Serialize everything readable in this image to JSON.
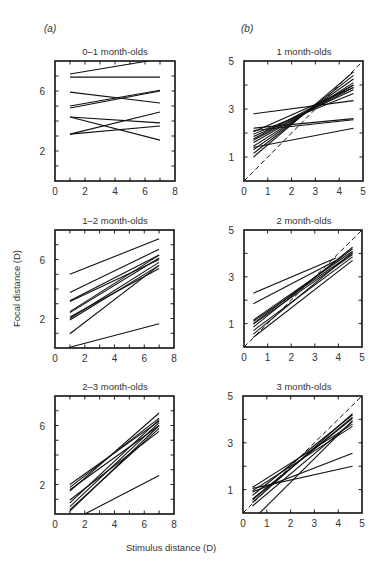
{
  "figure": {
    "column_labels": {
      "a": "(a)",
      "b": "(b)"
    },
    "x_axis_title": "Stimulus distance (D)",
    "y_axis_title": "Focal distance (D)"
  },
  "chart_data": [
    {
      "id": "a1",
      "type": "line",
      "title": "0–1 month-olds",
      "xlabel": "Stimulus distance (D)",
      "ylabel": "Focal distance (D)",
      "xlim": [
        0,
        8
      ],
      "ylim": [
        0,
        8
      ],
      "x_ticks": [
        0,
        2,
        4,
        6,
        8
      ],
      "y_tick_labels": [
        2,
        6
      ],
      "minor_ticks": 1,
      "grid": false,
      "reference_line": false,
      "box": {
        "left": 55,
        "top": 61,
        "width": 120,
        "height": 120
      },
      "series": [
        {
          "x": [
            1,
            6.2
          ],
          "y": [
            7.13,
            8.0
          ]
        },
        {
          "x": [
            1,
            7
          ],
          "y": [
            6.93,
            6.93
          ]
        },
        {
          "x": [
            1,
            7
          ],
          "y": [
            5.93,
            5.2
          ]
        },
        {
          "x": [
            1,
            7
          ],
          "y": [
            5.0,
            6.05
          ]
        },
        {
          "x": [
            1,
            7
          ],
          "y": [
            4.87,
            6.0
          ]
        },
        {
          "x": [
            1,
            7
          ],
          "y": [
            4.27,
            3.87
          ]
        },
        {
          "x": [
            1,
            7
          ],
          "y": [
            4.27,
            2.73
          ]
        },
        {
          "x": [
            1,
            7
          ],
          "y": [
            3.13,
            4.6
          ]
        },
        {
          "x": [
            1,
            7
          ],
          "y": [
            3.13,
            3.67
          ]
        }
      ]
    },
    {
      "id": "a2",
      "type": "line",
      "title": "1–2 month-olds",
      "xlabel": "Stimulus distance (D)",
      "ylabel": "Focal distance (D)",
      "xlim": [
        0,
        8
      ],
      "ylim": [
        0,
        8
      ],
      "x_ticks": [
        0,
        2,
        4,
        6,
        8
      ],
      "y_tick_labels": [
        2,
        6
      ],
      "minor_ticks": 1,
      "grid": false,
      "reference_line": false,
      "box": {
        "left": 55,
        "top": 230,
        "width": 119,
        "height": 118
      },
      "series": [
        {
          "x": [
            1,
            7
          ],
          "y": [
            5.0,
            7.4
          ]
        },
        {
          "x": [
            1,
            7
          ],
          "y": [
            3.76,
            6.7
          ]
        },
        {
          "x": [
            1,
            7
          ],
          "y": [
            3.2,
            6.3
          ]
        },
        {
          "x": [
            1,
            7
          ],
          "y": [
            3.15,
            6.0
          ]
        },
        {
          "x": [
            1,
            7
          ],
          "y": [
            2.47,
            6.3
          ]
        },
        {
          "x": [
            1,
            7
          ],
          "y": [
            2.4,
            6.1
          ]
        },
        {
          "x": [
            1,
            7
          ],
          "y": [
            2.0,
            5.8
          ]
        },
        {
          "x": [
            1,
            7
          ],
          "y": [
            1.9,
            5.6
          ]
        },
        {
          "x": [
            1,
            7
          ],
          "y": [
            2.1,
            5.4
          ]
        },
        {
          "x": [
            1,
            7
          ],
          "y": [
            0.96,
            5.6
          ]
        },
        {
          "x": [
            1,
            7
          ],
          "y": [
            0.05,
            1.65
          ]
        }
      ]
    },
    {
      "id": "a3",
      "type": "line",
      "title": "2–3 month-olds",
      "xlabel": "Stimulus distance (D)",
      "ylabel": "Focal distance (D)",
      "xlim": [
        0,
        8
      ],
      "ylim": [
        0,
        8
      ],
      "x_ticks": [
        0,
        2,
        4,
        6,
        8
      ],
      "y_tick_labels": [
        2,
        6
      ],
      "minor_ticks": 1,
      "grid": false,
      "reference_line": false,
      "box": {
        "left": 55,
        "top": 396,
        "width": 119,
        "height": 118
      },
      "series": [
        {
          "x": [
            1,
            7
          ],
          "y": [
            2.0,
            6.3
          ]
        },
        {
          "x": [
            1,
            7
          ],
          "y": [
            1.8,
            6.5
          ]
        },
        {
          "x": [
            1,
            7
          ],
          "y": [
            1.65,
            6.0
          ]
        },
        {
          "x": [
            1,
            7
          ],
          "y": [
            1.55,
            6.85
          ]
        },
        {
          "x": [
            1,
            7
          ],
          "y": [
            0.95,
            5.6
          ]
        },
        {
          "x": [
            1,
            7
          ],
          "y": [
            0.75,
            6.4
          ]
        },
        {
          "x": [
            1,
            7
          ],
          "y": [
            0.5,
            6.2
          ]
        },
        {
          "x": [
            1,
            7
          ],
          "y": [
            0.3,
            5.8
          ]
        },
        {
          "x": [
            1,
            7
          ],
          "y": [
            0.2,
            6.0
          ]
        },
        {
          "x": [
            2,
            7
          ],
          "y": [
            0.0,
            2.6
          ]
        }
      ]
    },
    {
      "id": "b1",
      "type": "line",
      "title": "1 month-olds",
      "xlabel": "Stimulus distance (D)",
      "ylabel": "Focal distance (D)",
      "xlim": [
        0,
        5
      ],
      "ylim": [
        0,
        5
      ],
      "x_ticks": [
        0,
        1,
        2,
        3,
        4,
        5
      ],
      "y_tick_labels": [
        1,
        3,
        5
      ],
      "minor_ticks": 1,
      "grid": false,
      "reference_line": true,
      "box": {
        "left": 244,
        "top": 61,
        "width": 119,
        "height": 120
      },
      "series": [
        {
          "x": [
            0.4,
            4.6
          ],
          "y": [
            2.8,
            3.35
          ]
        },
        {
          "x": [
            0.4,
            4.6
          ],
          "y": [
            2.2,
            2.6
          ]
        },
        {
          "x": [
            0.4,
            4.6
          ],
          "y": [
            2.1,
            2.55
          ]
        },
        {
          "x": [
            0.4,
            4.6
          ],
          "y": [
            1.95,
            3.65
          ]
        },
        {
          "x": [
            0.4,
            4.6
          ],
          "y": [
            1.85,
            3.8
          ]
        },
        {
          "x": [
            0.4,
            4.6
          ],
          "y": [
            1.7,
            3.9
          ]
        },
        {
          "x": [
            0.4,
            4.6
          ],
          "y": [
            1.6,
            4.0
          ]
        },
        {
          "x": [
            0.4,
            4.6
          ],
          "y": [
            1.45,
            4.1
          ]
        },
        {
          "x": [
            0.4,
            4.6
          ],
          "y": [
            1.3,
            4.25
          ]
        },
        {
          "x": [
            0.4,
            4.6
          ],
          "y": [
            1.15,
            4.4
          ]
        },
        {
          "x": [
            0.4,
            4.6
          ],
          "y": [
            1.0,
            4.55
          ]
        },
        {
          "x": [
            0.4,
            4.6
          ],
          "y": [
            1.4,
            2.2
          ]
        },
        {
          "x": [
            0.4,
            4.6
          ],
          "y": [
            2.05,
            3.9
          ]
        },
        {
          "x": [
            0.4,
            4.6
          ],
          "y": [
            1.75,
            4.0
          ]
        }
      ]
    },
    {
      "id": "b2",
      "type": "line",
      "title": "2 month-olds",
      "xlabel": "Stimulus distance (D)",
      "ylabel": "Focal distance (D)",
      "xlim": [
        0,
        5
      ],
      "ylim": [
        0,
        5
      ],
      "x_ticks": [
        0,
        1,
        2,
        3,
        4,
        5
      ],
      "y_tick_labels": [
        1,
        3,
        5
      ],
      "minor_ticks": 1,
      "grid": false,
      "reference_line": true,
      "box": {
        "left": 244,
        "top": 230,
        "width": 118,
        "height": 117
      },
      "series": [
        {
          "x": [
            0.4,
            3.9
          ],
          "y": [
            2.3,
            3.8
          ]
        },
        {
          "x": [
            0.4,
            3.9
          ],
          "y": [
            1.85,
            3.7
          ]
        },
        {
          "x": [
            0.4,
            4.6
          ],
          "y": [
            1.15,
            4.1
          ]
        },
        {
          "x": [
            0.4,
            4.6
          ],
          "y": [
            1.1,
            4.0
          ]
        },
        {
          "x": [
            0.4,
            4.6
          ],
          "y": [
            1.0,
            4.2
          ]
        },
        {
          "x": [
            0.4,
            4.6
          ],
          "y": [
            0.98,
            3.95
          ]
        },
        {
          "x": [
            0.4,
            4.6
          ],
          "y": [
            0.85,
            4.27
          ]
        },
        {
          "x": [
            0.4,
            4.6
          ],
          "y": [
            0.7,
            3.85
          ]
        },
        {
          "x": [
            0.4,
            4.6
          ],
          "y": [
            0.55,
            4.05
          ]
        },
        {
          "x": [
            0.4,
            4.6
          ],
          "y": [
            0.42,
            3.7
          ]
        }
      ]
    },
    {
      "id": "b3",
      "type": "line",
      "title": "3 month-olds",
      "xlabel": "Stimulus distance (D)",
      "ylabel": "Focal distance (D)",
      "xlim": [
        0,
        5
      ],
      "ylim": [
        0,
        5
      ],
      "x_ticks": [
        0,
        1,
        2,
        3,
        4,
        5
      ],
      "y_tick_labels": [
        1,
        3,
        5
      ],
      "minor_ticks": 1,
      "grid": false,
      "reference_line": true,
      "box": {
        "left": 243,
        "top": 396,
        "width": 119,
        "height": 117
      },
      "series": [
        {
          "x": [
            0.4,
            4.6
          ],
          "y": [
            1.05,
            2.0
          ]
        },
        {
          "x": [
            0.4,
            4.6
          ],
          "y": [
            0.9,
            2.55
          ]
        },
        {
          "x": [
            0.4,
            4.6
          ],
          "y": [
            1.1,
            3.8
          ]
        },
        {
          "x": [
            0.4,
            4.6
          ],
          "y": [
            0.75,
            4.2
          ]
        },
        {
          "x": [
            0.4,
            4.6
          ],
          "y": [
            0.6,
            4.05
          ]
        },
        {
          "x": [
            0.4,
            4.6
          ],
          "y": [
            0.45,
            4.25
          ]
        },
        {
          "x": [
            0.4,
            4.6
          ],
          "y": [
            0.3,
            3.9
          ]
        },
        {
          "x": [
            0.4,
            4.6
          ],
          "y": [
            0.55,
            4.1
          ]
        },
        {
          "x": [
            0.4,
            4.6
          ],
          "y": [
            0.95,
            3.7
          ]
        },
        {
          "x": [
            0.7,
            4.6
          ],
          "y": [
            0.0,
            3.95
          ]
        }
      ]
    }
  ]
}
